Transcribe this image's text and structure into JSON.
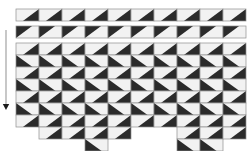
{
  "figure": {
    "title": "",
    "background_color": "#ffffff",
    "cell_fill": "#f2f2f2",
    "cell_stroke": "#8f8f8f",
    "triangle_fill": "#2b2b2b",
    "arrow_color": "#9a9a9a",
    "arrow_head_color": "#1c1c1c"
  },
  "arrow": {
    "label": "",
    "direction": "down",
    "x": 6,
    "y_start": 30,
    "y_end": 108
  },
  "grid": {
    "cell_width": 23,
    "cell_height": 12,
    "left": 16,
    "columns": 10,
    "strips": [
      {
        "name": "strip-top-1",
        "y": 9,
        "height": 12,
        "orientation": "dark-upper-right",
        "columns": 10
      },
      {
        "name": "strip-top-2",
        "y": 26,
        "height": 12,
        "orientation": "dark-upper-left",
        "columns": 10
      }
    ],
    "main": {
      "name": "main-grid",
      "y": 43,
      "rows": 7,
      "columns": 10,
      "row_orientations": [
        "dark-upper-right",
        "dark-lower-left",
        "dark-upper-right",
        "dark-lower-left",
        "dark-upper-right",
        "dark-lower-left",
        "dark-upper-right"
      ],
      "column_depths": [
        7,
        8,
        8,
        9,
        8,
        7,
        7,
        9,
        9,
        8
      ]
    }
  },
  "chart_data": {
    "type": "heatmap",
    "title": "",
    "xlabel": "",
    "ylabel": "",
    "categories": [
      "c1",
      "c2",
      "c3",
      "c4",
      "c5",
      "c6",
      "c7",
      "c8",
      "c9",
      "c10"
    ],
    "series": [
      {
        "name": "strip-1",
        "values": [
          1,
          1,
          1,
          1,
          1,
          1,
          1,
          1,
          1,
          1
        ]
      },
      {
        "name": "strip-2",
        "values": [
          2,
          2,
          2,
          2,
          2,
          2,
          2,
          2,
          2,
          2
        ]
      },
      {
        "name": "row-1",
        "values": [
          1,
          1,
          1,
          1,
          1,
          1,
          1,
          1,
          1,
          1
        ]
      },
      {
        "name": "row-2",
        "values": [
          3,
          3,
          3,
          3,
          3,
          3,
          3,
          3,
          3,
          3
        ]
      },
      {
        "name": "row-3",
        "values": [
          1,
          1,
          1,
          1,
          1,
          1,
          1,
          1,
          1,
          1
        ]
      },
      {
        "name": "row-4",
        "values": [
          3,
          3,
          3,
          3,
          3,
          3,
          3,
          3,
          3,
          3
        ]
      },
      {
        "name": "row-5",
        "values": [
          1,
          1,
          1,
          1,
          1,
          1,
          1,
          1,
          1,
          1
        ]
      },
      {
        "name": "row-6",
        "values": [
          3,
          3,
          3,
          3,
          3,
          3,
          3,
          3,
          3,
          3
        ]
      },
      {
        "name": "row-7",
        "values": [
          1,
          1,
          1,
          1,
          1,
          1,
          1,
          1,
          1,
          1
        ]
      }
    ],
    "legend": [],
    "grid": true
  }
}
